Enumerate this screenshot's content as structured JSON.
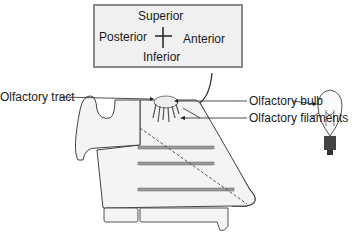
{
  "compass": {
    "superior": "Superior",
    "inferior": "Inferior",
    "posterior": "Posterior",
    "anterior": "Anterior"
  },
  "labels": {
    "olfactory_tract": "Olfactory tract",
    "olfactory_bulb": "Olfactory bulb",
    "olfactory_filaments": "Olfactory filaments"
  },
  "icons": {
    "analogy": "light-bulb-icon"
  },
  "colors": {
    "outline": "#4a4a4a",
    "fill": "#f2f2f2",
    "bar": "#9a9a9a",
    "compass_bg": "#f0f0f0"
  }
}
